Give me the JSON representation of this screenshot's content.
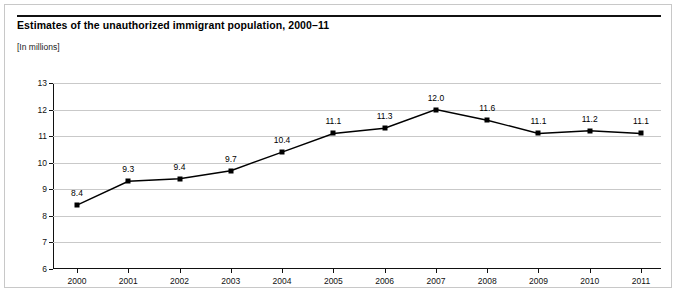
{
  "card": {
    "title": "Estimates of the unauthorized immigrant population, 2000–11",
    "subtitle": "[In millions]"
  },
  "chart_data": {
    "type": "line",
    "title": "Estimates of the unauthorized immigrant population, 2000–11",
    "subtitle": "[In millions]",
    "xlabel": "",
    "ylabel": "",
    "categories": [
      "2000",
      "2001",
      "2002",
      "2003",
      "2004",
      "2005",
      "2006",
      "2007",
      "2008",
      "2009",
      "2010",
      "2011"
    ],
    "values": [
      8.4,
      9.3,
      9.4,
      9.7,
      10.4,
      11.1,
      11.3,
      12.0,
      11.6,
      11.1,
      11.2,
      11.1
    ],
    "point_labels": [
      "8.4",
      "9.3",
      "9.4",
      "9.7",
      "10.4",
      "11.1",
      "11.3",
      "12.0",
      "11.6",
      "11.1",
      "11.2",
      "11.1"
    ],
    "ylim": [
      6,
      13
    ],
    "yticks": [
      6,
      7,
      8,
      9,
      10,
      11,
      12,
      13
    ],
    "ytick_labels": [
      "6",
      "7",
      "8",
      "9",
      "10",
      "11",
      "12",
      "13"
    ],
    "grid": true,
    "legend": "none",
    "line_color": "#000000",
    "marker_color": "#000000",
    "grid_color": "#c9c9c9"
  }
}
